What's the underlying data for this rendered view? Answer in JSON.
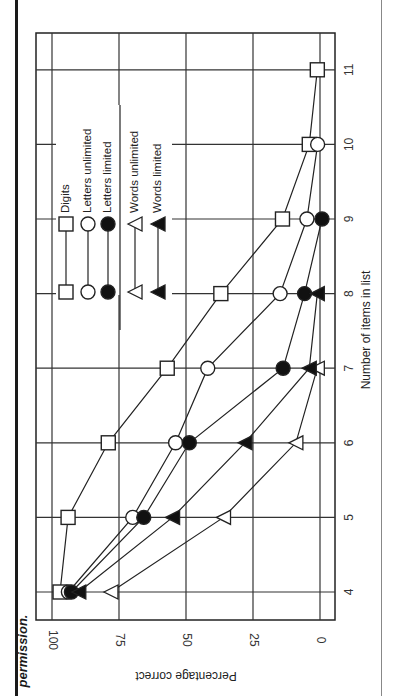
{
  "caption_fragment": "permission.",
  "chart_data": {
    "type": "line",
    "orientation_note": "figure rotated 90 degrees clockwise on page",
    "title": "",
    "xlabel": "Number of items in list",
    "ylabel": "Percentage correct",
    "x": [
      4,
      5,
      6,
      7,
      8,
      9,
      10,
      11
    ],
    "x_ticks": [
      "4",
      "5",
      "6",
      "7",
      "8",
      "9",
      "10",
      "11"
    ],
    "y_ticks": [
      "0",
      "25",
      "50",
      "75",
      "100"
    ],
    "ylim": [
      0,
      100
    ],
    "xlim": [
      4,
      11
    ],
    "grid": true,
    "legend_position": "inside upper-left (rotated)",
    "series": [
      {
        "name": "Digits",
        "marker": "square-open",
        "x": [
          4,
          5,
          6,
          7,
          8,
          9,
          10,
          11
        ],
        "values": [
          97,
          94,
          79,
          57,
          37,
          14,
          4,
          1
        ]
      },
      {
        "name": "Letters unlimited",
        "marker": "circle-open",
        "x": [
          4,
          5,
          6,
          7,
          8,
          9,
          10
        ],
        "values": [
          95,
          71,
          55,
          43,
          16,
          6,
          2
        ]
      },
      {
        "name": "Letters limited",
        "marker": "circle-filled",
        "x": [
          4,
          5,
          6,
          7,
          8,
          9
        ],
        "values": [
          95,
          68,
          51,
          16,
          8,
          1.5
        ]
      },
      {
        "name": "Words unlimited",
        "marker": "triangle-open",
        "x": [
          4,
          5,
          6,
          7
        ],
        "values": [
          78,
          36,
          9,
          1
        ]
      },
      {
        "name": "Words limited",
        "marker": "triangle-filled",
        "x": [
          4,
          5,
          6,
          7,
          8
        ],
        "values": [
          90,
          55,
          28,
          4,
          1
        ]
      }
    ]
  }
}
